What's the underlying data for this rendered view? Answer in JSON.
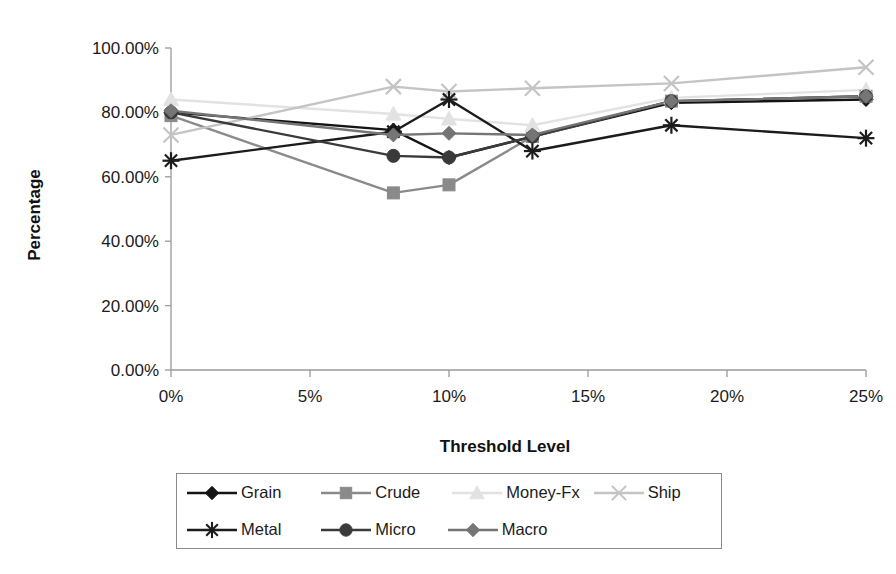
{
  "chart_data": {
    "type": "line",
    "title": "",
    "xlabel": "Threshold Level",
    "ylabel": "Percentage",
    "x": [
      0,
      8,
      10,
      13,
      18,
      25
    ],
    "xtick_labels": [
      "0%",
      "5%",
      "10%",
      "15%",
      "20%",
      "25%"
    ],
    "xtick_values": [
      0,
      5,
      10,
      15,
      20,
      25
    ],
    "xlim": [
      0,
      25
    ],
    "ytick_labels": [
      "0.00%",
      "20.00%",
      "40.00%",
      "60.00%",
      "80.00%",
      "100.00%"
    ],
    "ytick_values": [
      0,
      20,
      40,
      60,
      80,
      100
    ],
    "ylim": [
      0,
      100
    ],
    "grid": false,
    "legend_position": "bottom",
    "series": [
      {
        "name": "Grain",
        "marker": "diamond",
        "color": "#141414",
        "values": [
          80.0,
          74.5,
          66.0,
          72.5,
          83.0,
          84.0
        ]
      },
      {
        "name": "Crude",
        "marker": "square",
        "color": "#8a8a8a",
        "values": [
          79.0,
          55.0,
          57.5,
          72.5,
          83.5,
          85.0
        ]
      },
      {
        "name": "Money-Fx",
        "marker": "triangle",
        "color": "#e2e2e2",
        "values": [
          84.0,
          79.5,
          78.0,
          76.0,
          84.5,
          87.0
        ]
      },
      {
        "name": "Ship",
        "marker": "cross",
        "color": "#c4c4c4",
        "values": [
          73.0,
          88.0,
          86.5,
          87.5,
          89.0,
          94.0
        ]
      },
      {
        "name": "Metal",
        "marker": "asterisk",
        "color": "#1c1c1c",
        "values": [
          65.0,
          74.0,
          84.0,
          68.0,
          76.0,
          72.0
        ]
      },
      {
        "name": "Micro",
        "marker": "circle",
        "color": "#3a3a3a",
        "values": [
          80.0,
          66.5,
          66.0,
          72.5,
          83.5,
          85.0
        ]
      },
      {
        "name": "Macro",
        "marker": "diamond",
        "color": "#757575",
        "values": [
          80.5,
          73.0,
          73.5,
          73.0,
          83.5,
          85.0
        ]
      }
    ]
  },
  "legend": {
    "row1": [
      {
        "label": "Grain"
      },
      {
        "label": "Crude"
      },
      {
        "label": "Money-Fx"
      },
      {
        "label": "Ship"
      }
    ],
    "row2": [
      {
        "label": "Metal"
      },
      {
        "label": "Micro"
      },
      {
        "label": "Macro"
      }
    ]
  },
  "axis": {
    "y_title": "Percentage",
    "x_title": "Threshold Level"
  },
  "colors": {
    "axis": "#9a9a9a",
    "text": "#1b1b1b",
    "legend_border": "#8b8b8b"
  }
}
